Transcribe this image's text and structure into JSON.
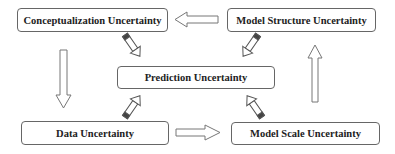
{
  "diagram": {
    "nodes": [
      {
        "id": "conceptualization",
        "label": "Conceptualization Uncertainty"
      },
      {
        "id": "model_structure",
        "label": "Model Structure Uncertainty"
      },
      {
        "id": "prediction",
        "label": "Prediction Uncertainty"
      },
      {
        "id": "data",
        "label": "Data Uncertainty"
      },
      {
        "id": "model_scale",
        "label": "Model Scale Uncertainty"
      }
    ],
    "edges": [
      {
        "from": "model_structure",
        "to": "conceptualization",
        "style": "hollow-arrow"
      },
      {
        "from": "conceptualization",
        "to": "data",
        "style": "hollow-arrow"
      },
      {
        "from": "data",
        "to": "model_scale",
        "style": "hollow-arrow"
      },
      {
        "from": "model_scale",
        "to": "model_structure",
        "style": "hollow-arrow"
      },
      {
        "from": "conceptualization",
        "to": "prediction",
        "style": "pencil-arrow"
      },
      {
        "from": "model_structure",
        "to": "prediction",
        "style": "pencil-arrow"
      },
      {
        "from": "data",
        "to": "prediction",
        "style": "pencil-arrow"
      },
      {
        "from": "model_scale",
        "to": "prediction",
        "style": "pencil-arrow"
      }
    ]
  }
}
